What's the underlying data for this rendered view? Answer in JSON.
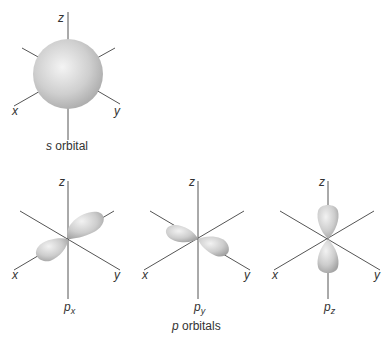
{
  "s_orbital": {
    "caption_italic": "s",
    "caption_rest": " orbital",
    "axes": {
      "z": "z",
      "x": "x",
      "y": "y"
    }
  },
  "p_orbitals": {
    "caption_italic": "p",
    "caption_rest": " orbitals",
    "items": [
      {
        "name": "p",
        "sub": "x",
        "axes": {
          "z": "z",
          "x": "x",
          "y": "y"
        }
      },
      {
        "name": "p",
        "sub": "y",
        "axes": {
          "z": "z",
          "x": "x",
          "y": "y"
        }
      },
      {
        "name": "p",
        "sub": "z",
        "axes": {
          "z": "z",
          "x": "x",
          "y": "y"
        }
      }
    ]
  },
  "colors": {
    "axis": "#555555",
    "lobe_light": "#f2f2f2",
    "lobe_dark": "#a8a8a8"
  }
}
